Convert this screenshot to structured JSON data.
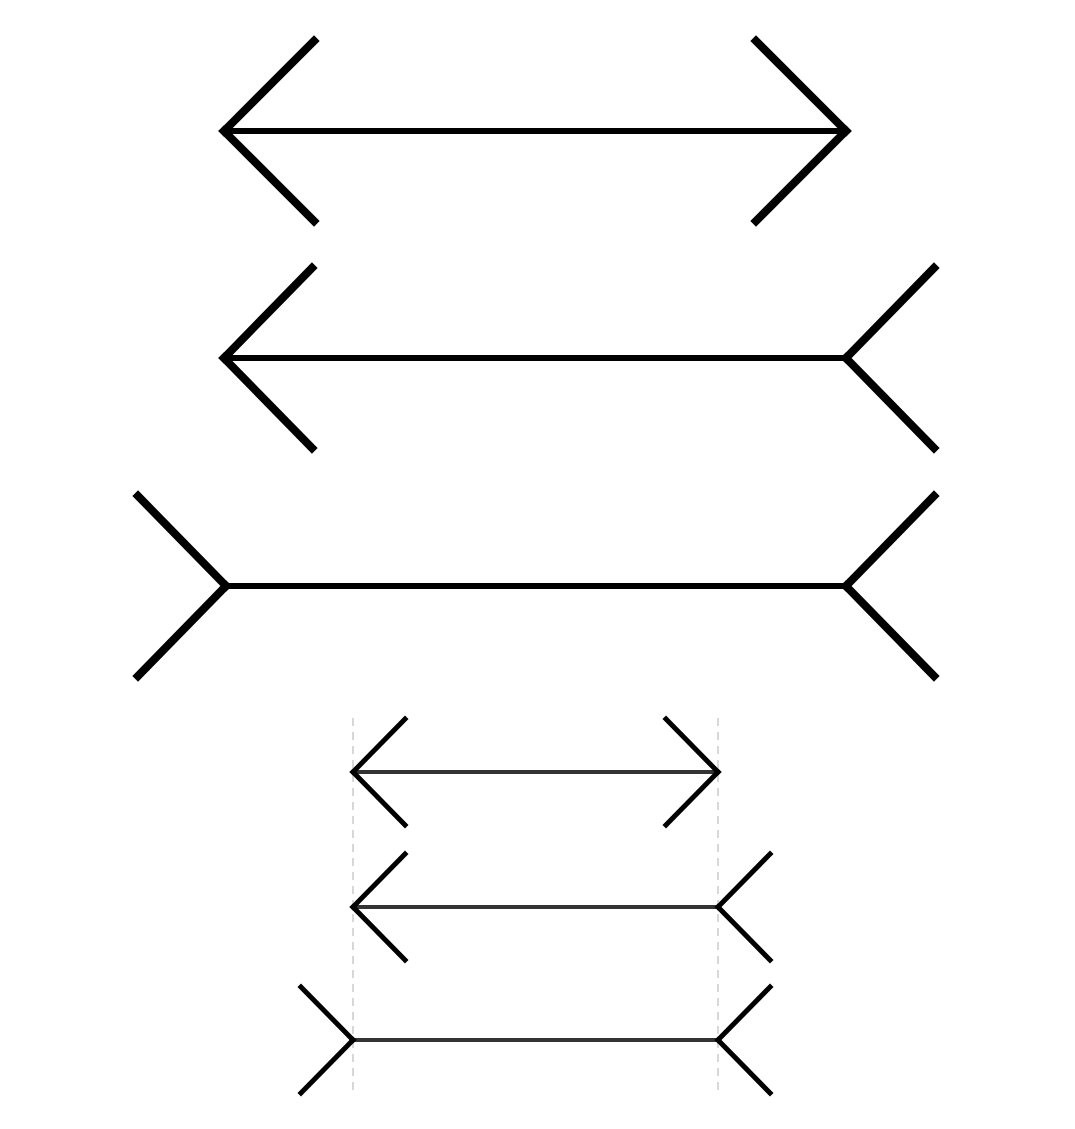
{
  "diagram": {
    "background": "#ffffff",
    "stroke_color": "#000000",
    "shaft_color_small": "#333333",
    "guide_color": "#cccccc",
    "large_figures": [
      {
        "id": "large-1",
        "left_x": 224,
        "right_x": 846,
        "y": 131,
        "left_fin": "arrowhead",
        "right_fin": "arrowhead",
        "fin_dx": 90,
        "fin_dy": 90
      },
      {
        "id": "large-2",
        "left_x": 224,
        "right_x": 846,
        "y": 358,
        "left_fin": "arrowhead",
        "right_fin": "tail",
        "fin_dx": 88,
        "fin_dy": 90
      },
      {
        "id": "large-3",
        "left_x": 226,
        "right_x": 846,
        "y": 586,
        "left_fin": "tail",
        "right_fin": "tail",
        "fin_dx": 88,
        "fin_dy": 90
      }
    ],
    "small_figures": [
      {
        "id": "small-1",
        "left_x": 353,
        "right_x": 718,
        "y": 772,
        "left_fin": "arrowhead",
        "right_fin": "arrowhead",
        "fin_dx": 52,
        "fin_dy": 53
      },
      {
        "id": "small-2",
        "left_x": 353,
        "right_x": 718,
        "y": 907,
        "left_fin": "arrowhead",
        "right_fin": "tail",
        "fin_dx": 52,
        "fin_dy": 53
      },
      {
        "id": "small-3",
        "left_x": 353,
        "right_x": 718,
        "y": 1040,
        "left_fin": "tail",
        "right_fin": "tail",
        "fin_dx": 52,
        "fin_dy": 53
      }
    ],
    "guide_lines": [
      {
        "id": "guide-left",
        "x": 353,
        "y1": 718,
        "y2": 1095
      },
      {
        "id": "guide-right",
        "x": 718,
        "y1": 718,
        "y2": 1095
      }
    ]
  }
}
